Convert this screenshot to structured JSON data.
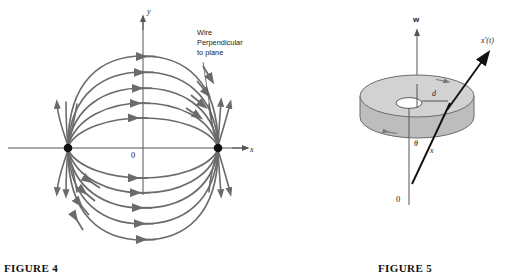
{
  "figure4": {
    "caption": "FIGURE 4",
    "axis_y_label": "y",
    "axis_x_label": "x",
    "origin_label": "0",
    "annotation": {
      "line1": "Wire",
      "line2": "Perpendicular",
      "line3": "to plane"
    },
    "colors": {
      "field_line": "#6b6b6b",
      "axis": "#555555",
      "pole": "#111111",
      "text": "#1a1a1a"
    },
    "description": "Magnetic field lines of two parallel wires perpendicular to the plane; arcs run between a left pole and a right pole on the x-axis"
  },
  "figure5": {
    "caption": "FIGURE 5",
    "axis_w_label": "w",
    "origin_label": "0",
    "vector_label": "x'(t)",
    "radius_label": "d",
    "angle_label": "θ",
    "ray_label": "x",
    "colors": {
      "disk_top": "#d2d2d2",
      "disk_side": "#bdbdbd",
      "disk_edge": "#6b6b6b",
      "hole": "#ffffff",
      "axis": "#555555",
      "vector": "#111111",
      "text": "#1a1a1a"
    },
    "description": "A flat annular disk (washer) centered on a vertical w-axis, with a ray x from the origin 0 making angle theta with the axis, passing through the disk at radius d, and a velocity vector x'(t)"
  }
}
